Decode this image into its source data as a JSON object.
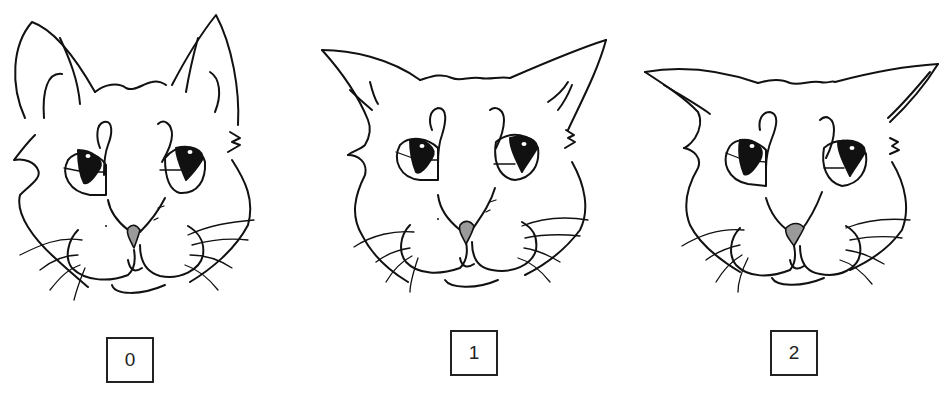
{
  "figure": {
    "colors": {
      "line": "#111111",
      "nose": "#9a9a9a",
      "background": "#ffffff"
    },
    "panels": [
      {
        "label": "0",
        "ear_position": "upright"
      },
      {
        "label": "1",
        "ear_position": "partially rotated outward"
      },
      {
        "label": "2",
        "ear_position": "flattened and rotated outward"
      }
    ]
  }
}
